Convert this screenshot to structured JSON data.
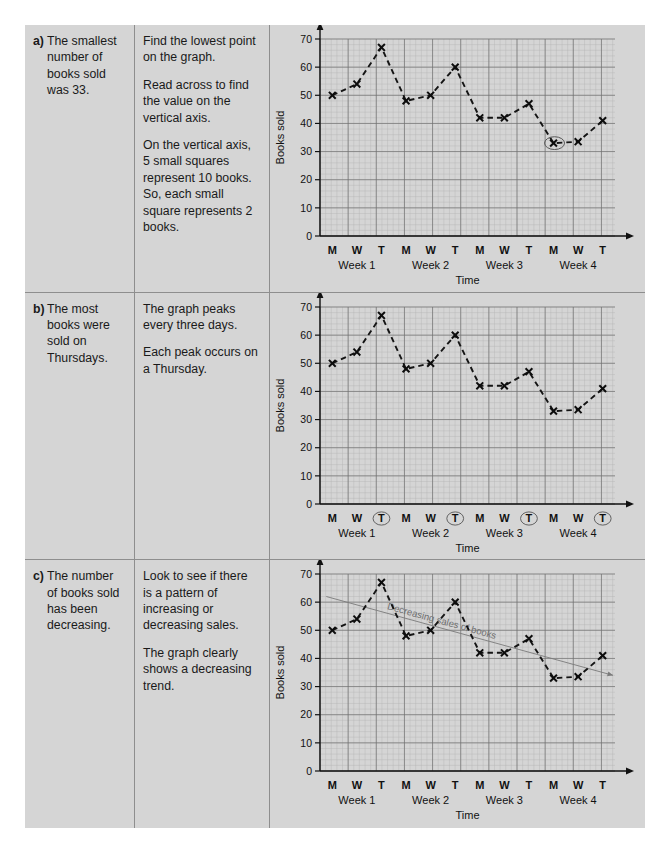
{
  "page": {
    "background": "#d5d5d5",
    "rows": [
      {
        "letter": "a)",
        "answer": "The smallest number of books sold was 33.",
        "steps": [
          "Find the lowest point on the graph.",
          "Read across to find the value on the vertical axis.",
          "On the vertical axis, 5 small squares represent 10 books.",
          "So, each small square represents 2 books."
        ]
      },
      {
        "letter": "b)",
        "answer": "The most books were sold on Thursdays.",
        "steps": [
          "The graph peaks every three days.",
          "Each peak occurs on a Thursday."
        ]
      },
      {
        "letter": "c)",
        "answer": "The number of books sold has been decreasing.",
        "steps": [
          "Look to see if there is a pattern of increasing or decreasing sales.",
          "The graph clearly shows a decreasing trend."
        ]
      }
    ]
  },
  "chart_data": [
    {
      "id": "chart-a",
      "type": "line",
      "title": "",
      "xlabel": "Time",
      "ylabel": "Books sold",
      "ylim": [
        0,
        70
      ],
      "yticks": [
        0,
        10,
        20,
        30,
        40,
        50,
        60,
        70
      ],
      "grid": true,
      "minor_grid_step": 2,
      "marker": "x",
      "linestyle": "dashed",
      "categories": [
        "M",
        "W",
        "T",
        "M",
        "W",
        "T",
        "M",
        "W",
        "T",
        "M",
        "W",
        "T"
      ],
      "groups": [
        "Week 1",
        "Week 2",
        "Week 3",
        "Week 4"
      ],
      "values": [
        50,
        54,
        67,
        48,
        50,
        60,
        42,
        42,
        47,
        33,
        33.5,
        41
      ],
      "annotations": [
        {
          "kind": "ellipse-highlight",
          "target_index": 9,
          "target_value": 33,
          "note": "lowest point circled"
        }
      ]
    },
    {
      "id": "chart-b",
      "type": "line",
      "title": "",
      "xlabel": "Time",
      "ylabel": "Books sold",
      "ylim": [
        0,
        70
      ],
      "yticks": [
        0,
        10,
        20,
        30,
        40,
        50,
        60,
        70
      ],
      "grid": true,
      "minor_grid_step": 2,
      "marker": "x",
      "linestyle": "dashed",
      "categories": [
        "M",
        "W",
        "T",
        "M",
        "W",
        "T",
        "M",
        "W",
        "T",
        "M",
        "W",
        "T"
      ],
      "groups": [
        "Week 1",
        "Week 2",
        "Week 3",
        "Week 4"
      ],
      "values": [
        50,
        54,
        67,
        48,
        50,
        60,
        42,
        42,
        47,
        33,
        33.5,
        41
      ],
      "annotations": [
        {
          "kind": "ellipse-highlight-xlabels",
          "target_labels": [
            "T",
            "T",
            "T",
            "T"
          ],
          "target_indices": [
            2,
            5,
            8,
            11
          ],
          "note": "each Thursday tick label circled"
        }
      ]
    },
    {
      "id": "chart-c",
      "type": "line",
      "title": "",
      "xlabel": "Time",
      "ylabel": "Books sold",
      "ylim": [
        0,
        70
      ],
      "yticks": [
        0,
        10,
        20,
        30,
        40,
        50,
        60,
        70
      ],
      "grid": true,
      "minor_grid_step": 2,
      "marker": "x",
      "linestyle": "dashed",
      "categories": [
        "M",
        "W",
        "T",
        "M",
        "W",
        "T",
        "M",
        "W",
        "T",
        "M",
        "W",
        "T"
      ],
      "groups": [
        "Week 1",
        "Week 2",
        "Week 3",
        "Week 4"
      ],
      "values": [
        50,
        54,
        67,
        48,
        50,
        60,
        42,
        42,
        47,
        33,
        33.5,
        41
      ],
      "annotations": [
        {
          "kind": "trend-line",
          "label": "Decreasing sales of books",
          "start_value": 62,
          "end_value": 34,
          "color": "#7a7a7a",
          "arrow": true
        }
      ]
    }
  ]
}
